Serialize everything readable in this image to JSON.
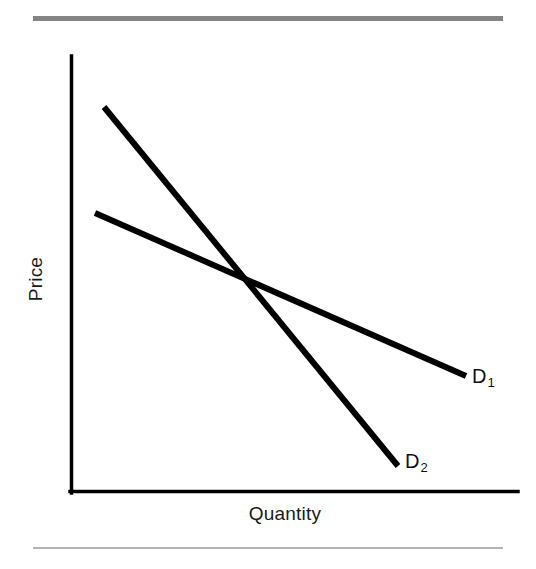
{
  "figure": {
    "type": "economics-demand-curve-diagram",
    "background_color": "#ffffff",
    "rules": {
      "top_color": "#848484",
      "bottom_color": "#b4b4b4"
    },
    "axes": {
      "x_label": "Quantity",
      "y_label": "Price",
      "axis_color": "#000000",
      "origin_px": [
        70,
        493
      ],
      "y_axis_top_px": [
        70,
        56
      ],
      "x_axis_right_px": [
        518,
        493
      ]
    },
    "curves": [
      {
        "id": "D1",
        "label": "D",
        "subscript": "1",
        "description": "flatter demand curve (more elastic)",
        "color": "#000000",
        "start_px": [
          95,
          213
        ],
        "end_px": [
          466,
          376
        ]
      },
      {
        "id": "D2",
        "label": "D",
        "subscript": "2",
        "description": "steeper demand curve (less elastic)",
        "color": "#000000",
        "start_px": [
          104,
          107
        ],
        "end_px": [
          398,
          466
        ]
      }
    ],
    "intersection_px": [
      246,
      285
    ]
  },
  "chart_data": {
    "type": "line",
    "title": "",
    "xlabel": "Quantity",
    "ylabel": "Price",
    "xlim": [
      0,
      100
    ],
    "ylim": [
      0,
      100
    ],
    "grid": false,
    "legend": "inline-end-labels",
    "annotations": [
      {
        "text": "D1",
        "x": 90,
        "y": 27
      },
      {
        "text": "D2",
        "x": 75,
        "y": 7
      }
    ],
    "series": [
      {
        "name": "D1",
        "label": "D₁",
        "x": [
          5.6,
          88.4
        ],
        "y": [
          64.1,
          26.8
        ]
      },
      {
        "name": "D2",
        "label": "D₂",
        "x": [
          7.6,
          73.2
        ],
        "y": [
          88.3,
          6.2
        ]
      }
    ],
    "intersection": {
      "x": 39.3,
      "y": 47.6
    }
  }
}
